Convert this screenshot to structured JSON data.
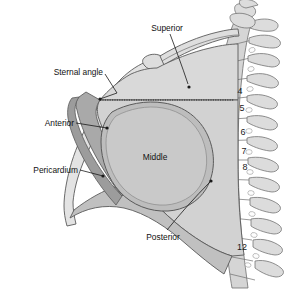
{
  "figure": {
    "background_color": "#ffffff"
  },
  "labels": {
    "superior": "Superior",
    "sternal_angle": "Sternal angle",
    "anterior": "Anterior",
    "pericardium": "Pericardium",
    "middle": "Middle",
    "posterior": "Posterior"
  },
  "vertebrae": [
    {
      "number": "4",
      "x": 240,
      "y": 94
    },
    {
      "number": "5",
      "x": 242,
      "y": 111
    },
    {
      "number": "6",
      "x": 243,
      "y": 135
    },
    {
      "number": "7",
      "x": 244,
      "y": 154
    },
    {
      "number": "8",
      "x": 245,
      "y": 170
    },
    {
      "number": "12",
      "x": 242,
      "y": 250
    }
  ],
  "colors": {
    "superior_fill": "#d9d9d9",
    "middle_fill": "#c9c9c9",
    "posterior_fill": "#d2d2d2",
    "anterior_fill": "#a9a9a9",
    "pericardium_fill": "#bdbdbd",
    "sternum_fill": "#e3e3e3",
    "vertebra_fill": "#d5d5d5",
    "outline": "#5a5a5a",
    "text": "#111111"
  }
}
